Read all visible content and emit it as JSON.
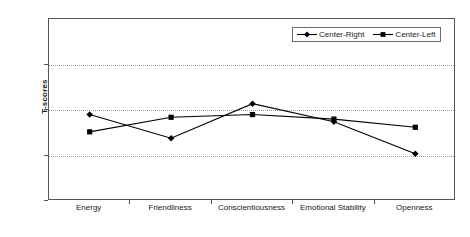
{
  "chart_data": {
    "type": "line",
    "title": "",
    "xlabel": "",
    "ylabel": "T-scores",
    "ylim": [
      40,
      60
    ],
    "yticks": [
      40,
      45,
      50,
      55,
      60
    ],
    "grid": "horizontal-dotted",
    "legend_position": "top-right-inside",
    "categories": [
      "Energy",
      "Friendliness",
      "Conscientiousness",
      "Emotional Stability",
      "Openness"
    ],
    "series": [
      {
        "name": "Center-Right",
        "marker": "diamond",
        "color": "#000000",
        "values": [
          49.5,
          46.9,
          50.7,
          48.7,
          45.2
        ]
      },
      {
        "name": "Center-Left",
        "marker": "square",
        "color": "#000000",
        "values": [
          47.6,
          49.2,
          49.5,
          49.0,
          48.1
        ]
      }
    ]
  },
  "axis": {
    "y_tick_labels": [
      "60",
      "55",
      "50",
      "45",
      "40"
    ],
    "y_title": "T-scores"
  },
  "legend": {
    "items": [
      {
        "label": "Center-Right",
        "marker": "diamond-marker-icon"
      },
      {
        "label": "Center-Left",
        "marker": "square-marker-icon"
      }
    ]
  }
}
